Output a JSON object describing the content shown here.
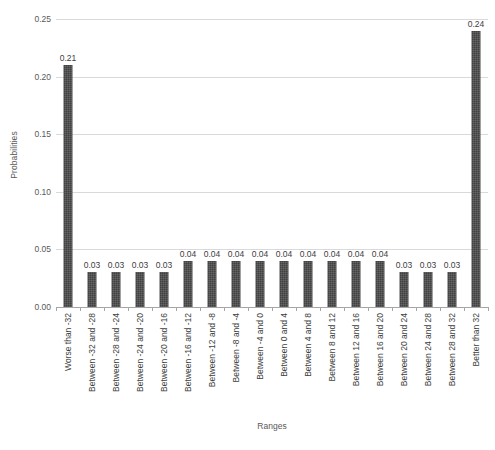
{
  "chart_data": {
    "type": "bar",
    "title": "",
    "subtitle": "",
    "xlabel": "Ranges",
    "ylabel": "Probabilities",
    "ylim": [
      0,
      0.25
    ],
    "yticks": [
      "0.00",
      "0.05",
      "0.10",
      "0.15",
      "0.20",
      "0.25"
    ],
    "ytick_values": [
      0,
      0.05,
      0.1,
      0.15,
      0.2,
      0.25
    ],
    "grid": true,
    "legend": false,
    "legend_position": "none",
    "bar_color": "#404040",
    "gridline_color": "#D9D9D9",
    "axis_color": "#A6A6A6",
    "text_color": "#595959",
    "categories": [
      "Worse than -32",
      "Between -32 and -28",
      "Between -28 and -24",
      "Between -24 and -20",
      "Between -20 and -16",
      "Between -16 and -12",
      "Between -12 and -8",
      "Between -8 and -4",
      "Between -4 and 0",
      "Between 0 and 4",
      "Between 4 and 8",
      "Between 8 and 12",
      "Between 12 and 16",
      "Between 16 and 20",
      "Between 20 and 24",
      "Between 24 and 28",
      "Between 28 and 32",
      "Better than 32"
    ],
    "values": [
      0.21,
      0.03,
      0.03,
      0.03,
      0.03,
      0.04,
      0.04,
      0.04,
      0.04,
      0.04,
      0.04,
      0.04,
      0.04,
      0.04,
      0.03,
      0.03,
      0.03,
      0.24
    ],
    "data_labels": [
      "0.21",
      "0.03",
      "0.03",
      "0.03",
      "0.03",
      "0.04",
      "0.04",
      "0.04",
      "0.04",
      "0.04",
      "0.04",
      "0.04",
      "0.04",
      "0.04",
      "0.03",
      "0.03",
      "0.03",
      "0.24"
    ]
  }
}
